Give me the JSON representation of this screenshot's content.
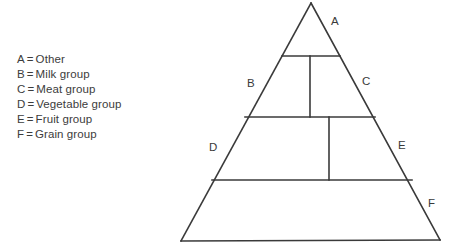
{
  "diagram": {
    "line_color": "#3a3a3a",
    "background_color": "#ffffff",
    "text_color": "#3c3c3c"
  },
  "legend": {
    "separator": "=",
    "items": [
      {
        "key": "A",
        "label": "Other"
      },
      {
        "key": "B",
        "label": "Milk group"
      },
      {
        "key": "C",
        "label": "Meat group"
      },
      {
        "key": "D",
        "label": "Vegetable group"
      },
      {
        "key": "E",
        "label": "Fruit group"
      },
      {
        "key": "F",
        "label": "Grain group"
      }
    ]
  },
  "pyramid": {
    "labels": [
      {
        "key": "A",
        "x": 331,
        "y": 25
      },
      {
        "key": "B",
        "x": 247,
        "y": 87
      },
      {
        "key": "C",
        "x": 362,
        "y": 85
      },
      {
        "key": "D",
        "x": 209,
        "y": 151
      },
      {
        "key": "E",
        "x": 398,
        "y": 149
      },
      {
        "key": "F",
        "x": 428,
        "y": 207
      }
    ]
  }
}
